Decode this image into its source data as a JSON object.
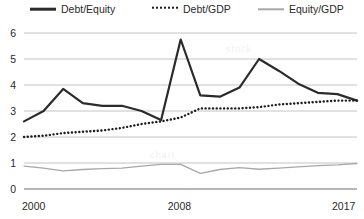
{
  "legend": {
    "position": "top",
    "entries": [
      {
        "label": "Debt/Equity",
        "style": "solid-thick",
        "color": "#2b2b2b"
      },
      {
        "label": "Debt/GDP",
        "style": "dotted",
        "color": "#1d1d1d"
      },
      {
        "label": "Equity/GDP",
        "style": "solid-thin",
        "color": "#a8a8a8"
      }
    ]
  },
  "axes": {
    "y_ticks": [
      "0",
      "1",
      "2",
      "3",
      "4",
      "5",
      "6"
    ],
    "x_ticks": [
      "2000",
      "2008",
      "2017"
    ]
  },
  "chart_data": {
    "type": "line",
    "title": "",
    "xlabel": "",
    "ylabel": "",
    "xlim": [
      2000,
      2017
    ],
    "ylim": [
      0,
      6
    ],
    "grid": true,
    "legend_position": "top",
    "x": [
      2000,
      2001,
      2002,
      2003,
      2004,
      2005,
      2006,
      2007,
      2008,
      2009,
      2010,
      2011,
      2012,
      2013,
      2014,
      2015,
      2016,
      2017
    ],
    "series": [
      {
        "name": "Debt/Equity",
        "style": "solid-thick",
        "color": "#2b2b2b",
        "values": [
          2.6,
          3.0,
          3.85,
          3.3,
          3.2,
          3.2,
          3.0,
          2.65,
          5.75,
          3.6,
          3.55,
          3.9,
          5.0,
          4.55,
          4.05,
          3.7,
          3.65,
          3.4
        ]
      },
      {
        "name": "Debt/GDP",
        "style": "dotted",
        "color": "#1d1d1d",
        "values": [
          2.0,
          2.05,
          2.15,
          2.2,
          2.25,
          2.35,
          2.5,
          2.6,
          2.75,
          3.1,
          3.1,
          3.1,
          3.15,
          3.25,
          3.3,
          3.35,
          3.4,
          3.4
        ]
      },
      {
        "name": "Equity/GDP",
        "style": "solid-thin",
        "color": "#a8a8a8",
        "values": [
          0.88,
          0.8,
          0.7,
          0.75,
          0.78,
          0.8,
          0.88,
          0.95,
          0.95,
          0.6,
          0.75,
          0.82,
          0.76,
          0.8,
          0.85,
          0.9,
          0.93,
          0.98
        ]
      }
    ]
  },
  "watermarks": [
    {
      "text": "stock",
      "x": 226,
      "y": 44
    },
    {
      "text": "chart",
      "x": 150,
      "y": 150
    }
  ]
}
